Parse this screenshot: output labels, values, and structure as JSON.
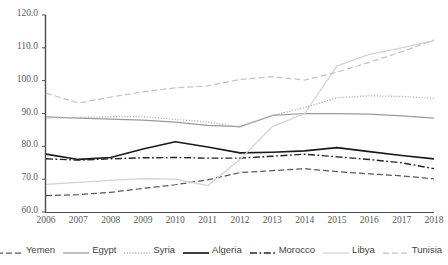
{
  "chart_data": {
    "type": "line",
    "title": "",
    "xlabel": "",
    "ylabel": "",
    "categories": [
      "2006",
      "2007",
      "2008",
      "2009",
      "2010",
      "2011",
      "2012",
      "2013",
      "2014",
      "2015",
      "2016",
      "2017",
      "2018"
    ],
    "x": [
      2006,
      2007,
      2008,
      2009,
      2010,
      2011,
      2012,
      2013,
      2014,
      2015,
      2016,
      2017,
      2018
    ],
    "ylim": [
      60.0,
      120.0
    ],
    "ytick_labels": [
      "120.0",
      "110.0",
      "100.0",
      "90.0",
      "80.0",
      "70.0",
      "60.0"
    ],
    "ytick_values": [
      120.0,
      110.0,
      100.0,
      90.0,
      80.0,
      70.0,
      60.0
    ],
    "grid": false,
    "legend_position": "bottom",
    "series": [
      {
        "name": "Yemen",
        "style": "dashed",
        "color": "#595959",
        "values": [
          65.0,
          65.3,
          66.0,
          67.2,
          68.3,
          69.8,
          72.0,
          72.6,
          73.2,
          72.3,
          71.6,
          71.0,
          70.1
        ]
      },
      {
        "name": "Egypt",
        "style": "solid",
        "color": "#9a9a9a",
        "values": [
          89.0,
          88.6,
          88.3,
          88.0,
          87.4,
          86.4,
          86.0,
          89.4,
          90.0,
          90.0,
          89.8,
          89.3,
          88.6
        ]
      },
      {
        "name": "Syria",
        "style": "dotted",
        "color": "#b5b5b5",
        "values": [
          88.6,
          88.8,
          89.0,
          89.1,
          88.2,
          87.4,
          85.8,
          89.4,
          91.8,
          94.8,
          95.4,
          95.2,
          94.6
        ]
      },
      {
        "name": "Algeria",
        "style": "solid",
        "color": "#1a1a1a",
        "values": [
          77.6,
          76.0,
          76.6,
          79.2,
          81.4,
          79.8,
          78.0,
          78.2,
          78.6,
          79.6,
          78.4,
          77.2,
          76.2
        ]
      },
      {
        "name": "Morocco",
        "style": "dashdot",
        "color": "#262626",
        "values": [
          76.2,
          75.8,
          76.2,
          76.5,
          76.6,
          76.4,
          76.4,
          77.0,
          77.6,
          76.8,
          76.0,
          75.0,
          73.2
        ]
      },
      {
        "name": "Libya",
        "style": "solid",
        "color": "#d2d2d2",
        "values": [
          68.4,
          69.0,
          69.6,
          70.2,
          70.0,
          68.0,
          76.0,
          86.0,
          90.0,
          104.5,
          108.0,
          110.0,
          112.2
        ]
      },
      {
        "name": "Tunisia",
        "style": "dashed",
        "color": "#c4c4c4",
        "values": [
          96.2,
          93.2,
          95.0,
          96.6,
          97.8,
          98.4,
          100.4,
          101.2,
          100.2,
          102.6,
          105.6,
          108.8,
          112.4
        ]
      }
    ]
  },
  "axis": {
    "y_labels": [
      "120.0",
      "110.0",
      "100.0",
      "90.0",
      "80.0",
      "70.0",
      "60.0"
    ],
    "x_labels": [
      "2006",
      "2007",
      "2008",
      "2009",
      "2010",
      "2011",
      "2012",
      "2013",
      "2014",
      "2015",
      "2016",
      "2017",
      "2018"
    ]
  },
  "legend": {
    "entries": [
      {
        "label": "Yemen"
      },
      {
        "label": "Egypt"
      },
      {
        "label": "Syria"
      },
      {
        "label": "Algeria"
      },
      {
        "label": "Morocco"
      },
      {
        "label": "Libya"
      },
      {
        "label": "Tunisia"
      }
    ]
  }
}
